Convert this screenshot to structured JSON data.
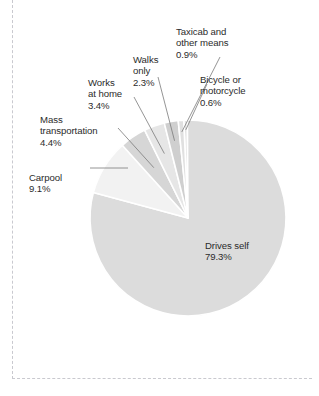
{
  "chart_data": {
    "type": "pie",
    "title": "",
    "subtitle": "",
    "xlabel": "",
    "ylabel": "",
    "legend_position": "none",
    "grid": false,
    "units": "percent",
    "label_format": "name + percent",
    "start_angle_deg": 357.5,
    "direction": "clockwise",
    "categories": [
      "Bicycle or motorcycle",
      "Drives self",
      "Carpool",
      "Mass transportation",
      "Works at home",
      "Walks only",
      "Taxicab and other means"
    ],
    "values": [
      0.6,
      79.3,
      9.1,
      4.4,
      3.4,
      2.3,
      0.9
    ],
    "slices": [
      {
        "name": "bicycle",
        "label": "Bicycle or",
        "label2": "motorcycle",
        "percent_text": "0.6%",
        "value": 0.6,
        "color": "#e2e2e2",
        "label_placement": "outside",
        "leader": true
      },
      {
        "name": "drives-self",
        "label": "Drives self",
        "label2": "",
        "percent_text": "79.3%",
        "value": 79.3,
        "color": "#dcdcdc",
        "label_placement": "inside",
        "leader": false
      },
      {
        "name": "carpool",
        "label": "Carpool",
        "label2": "",
        "percent_text": "9.1%",
        "value": 9.1,
        "color": "#f2f2f2",
        "label_placement": "outside",
        "leader": true
      },
      {
        "name": "mass-transportation",
        "label": "Mass",
        "label2": "transportation",
        "percent_text": "4.4%",
        "value": 4.4,
        "color": "#d6d6d6",
        "label_placement": "outside",
        "leader": true
      },
      {
        "name": "works-at-home",
        "label": "Works",
        "label2": "at home",
        "percent_text": "3.4%",
        "value": 3.4,
        "color": "#e6e6e6",
        "label_placement": "outside",
        "leader": true
      },
      {
        "name": "walks-only",
        "label": "Walks",
        "label2": "only",
        "percent_text": "2.3%",
        "value": 2.3,
        "color": "#cfcfcf",
        "label_placement": "outside",
        "leader": true
      },
      {
        "name": "taxicab",
        "label": "Taxicab and",
        "label2": "other means",
        "percent_text": "0.9%",
        "value": 0.9,
        "color": "#e0e0e0",
        "label_placement": "outside",
        "leader": true
      }
    ],
    "geometry": {
      "center_x": 188,
      "center_y": 218,
      "radius": 98,
      "separator_color": "#ffffff",
      "separator_width": 1.6
    },
    "colors": {
      "background": "#ffffff",
      "text": "#2b2b2b",
      "leader_line": "#7a7a7a",
      "frame_rule": "#c9c9cf"
    }
  }
}
